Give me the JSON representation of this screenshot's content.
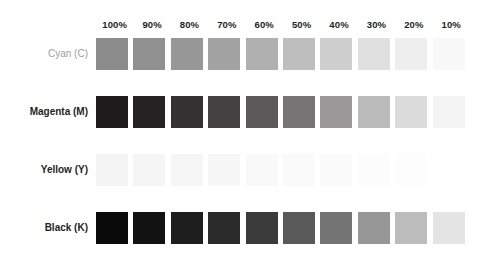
{
  "page": {
    "background": "#ffffff",
    "width": 486,
    "height": 261
  },
  "header": {
    "percent_labels": [
      "100%",
      "90%",
      "80%",
      "70%",
      "60%",
      "50%",
      "40%",
      "30%",
      "20%",
      "10%"
    ]
  },
  "rows": [
    {
      "label": "Cyan (C)",
      "ink": "C",
      "label_color": "#9d9d9d",
      "label_bold": false
    },
    {
      "label": "Magenta (M)",
      "ink": "M",
      "label_color": "#231f20",
      "label_bold": true
    },
    {
      "label": "Yellow (Y)",
      "ink": "Y",
      "label_color": "#231f20",
      "label_bold": true
    },
    {
      "label": "Black (K)",
      "ink": "K",
      "label_color": "#231f20",
      "label_bold": true
    }
  ],
  "chart_data": {
    "type": "heatmap",
    "subtitle": "",
    "xlabel": "",
    "ylabel": "",
    "grid": false,
    "legend": "none",
    "note": "Grayscale rendering of a four-ink tint ramp; each cell value is the rendered gray level of that tint patch.",
    "x": [
      100,
      90,
      80,
      70,
      60,
      50,
      40,
      30,
      20,
      10
    ],
    "categories": [
      "100%",
      "90%",
      "80%",
      "70%",
      "60%",
      "50%",
      "40%",
      "30%",
      "20%",
      "10%"
    ],
    "rows": [
      "Cyan (C)",
      "Magenta (M)",
      "Yellow (Y)",
      "Black (K)"
    ],
    "series": [
      {
        "name": "Cyan (C)",
        "tints": [
          100,
          90,
          80,
          70,
          60,
          50,
          40,
          30,
          20,
          10
        ],
        "values": [
          "#8c8c8c",
          "#909090",
          "#989898",
          "#a3a3a3",
          "#b0b0b0",
          "#bebebe",
          "#cfcfcf",
          "#e0e0e0",
          "#eeeeee",
          "#f8f8f8"
        ]
      },
      {
        "name": "Magenta (M)",
        "tints": [
          100,
          90,
          80,
          70,
          60,
          50,
          40,
          30,
          20,
          10
        ],
        "values": [
          "#1d1b1c",
          "#242223",
          "#333132",
          "#434142",
          "#5a5859",
          "#767474",
          "#9a9899",
          "#bcbbbb",
          "#dcdbdb",
          "#f3f3f3"
        ]
      },
      {
        "name": "Yellow (Y)",
        "tints": [
          100,
          90,
          80,
          70,
          60,
          50,
          40,
          30,
          20,
          10
        ],
        "values": [
          "#f4f4f4",
          "#f5f5f5",
          "#f6f6f6",
          "#f7f7f7",
          "#f9f9f9",
          "#fafafa",
          "#fbfbfb",
          "#fcfcfc",
          "#fdfdfd",
          "#fefefe"
        ]
      },
      {
        "name": "Black (K)",
        "tints": [
          100,
          90,
          80,
          70,
          60,
          50,
          40,
          30,
          20,
          10
        ],
        "values": [
          "#0b0a0a",
          "#131212",
          "#1f1e1e",
          "#2c2b2b",
          "#3c3b3b",
          "#5a5959",
          "#757474",
          "#989797",
          "#bdbcbc",
          "#e4e4e4"
        ]
      }
    ]
  }
}
